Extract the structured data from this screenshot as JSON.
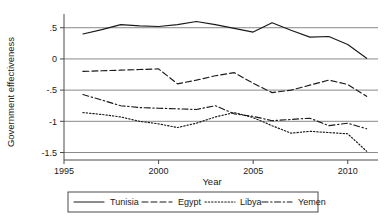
{
  "chart_data": {
    "type": "line",
    "title": "",
    "xlabel": "Year",
    "ylabel": "Government effectiveness",
    "xlim": [
      1995,
      2011.6
    ],
    "ylim": [
      -1.62,
      0.72
    ],
    "xticks": [
      1995,
      2000,
      2005,
      2010
    ],
    "xticklabels": [
      "1995",
      "2000",
      "2005",
      "2010"
    ],
    "yticks": [
      0.5,
      0,
      -0.5,
      -1,
      -1.5
    ],
    "yticklabels": [
      ".5",
      "0",
      "-.5",
      "-1",
      "-1.5"
    ],
    "grid": "horizontal",
    "legend_position": "below",
    "x": [
      1996,
      1997,
      1998,
      1999,
      2000,
      2001,
      2002,
      2003,
      2004,
      2005,
      2006,
      2007,
      2008,
      2009,
      2010,
      2011
    ],
    "series": [
      {
        "name": "Tunisia",
        "style": "solid",
        "values": [
          0.4,
          0.47,
          0.55,
          0.53,
          0.52,
          0.55,
          0.6,
          0.55,
          0.49,
          0.43,
          0.58,
          0.46,
          0.35,
          0.36,
          0.23,
          0.01
        ]
      },
      {
        "name": "Egypt",
        "style": "dashed",
        "values": [
          -0.2,
          -0.19,
          -0.18,
          -0.17,
          -0.16,
          -0.4,
          -0.34,
          -0.27,
          -0.22,
          -0.39,
          -0.54,
          -0.5,
          -0.42,
          -0.34,
          -0.41,
          -0.6
        ]
      },
      {
        "name": "Libya",
        "style": "dotted",
        "values": [
          -0.86,
          -0.89,
          -0.93,
          -1.0,
          -1.04,
          -1.1,
          -1.03,
          -0.93,
          -0.86,
          -0.94,
          -1.07,
          -1.19,
          -1.16,
          -1.18,
          -1.2,
          -1.48
        ]
      },
      {
        "name": "Yemen",
        "style": "dashdot",
        "values": [
          -0.57,
          -0.66,
          -0.75,
          -0.78,
          -0.79,
          -0.8,
          -0.81,
          -0.75,
          -0.88,
          -0.92,
          -0.99,
          -0.97,
          -0.95,
          -1.07,
          -1.03,
          -1.12
        ]
      }
    ]
  },
  "legend": {
    "entries": [
      {
        "label": "Tunisia",
        "style": "solid"
      },
      {
        "label": "Egypt",
        "style": "dashed"
      },
      {
        "label": "Libya",
        "style": "dotted"
      },
      {
        "label": "Yemen",
        "style": "dashdot"
      }
    ]
  }
}
